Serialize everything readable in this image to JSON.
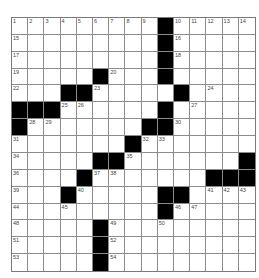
{
  "puzzle": {
    "rows": 15,
    "cols": 15,
    "colors": {
      "block": "#000000",
      "cell": "#ffffff",
      "gridline": "#8c8c8c",
      "number": "#444444"
    },
    "layout": [
      ".........#.....",
      ".........#.....",
      ".........#.....",
      ".....#...#.....",
      "...##.....#....",
      "###......#.....",
      "#.......##.....",
      ".......#.......",
      ".....##.......#",
      "....#.......###",
      "...#.....##....",
      ".........#.....",
      ".....#.........",
      ".....#.........",
      ".....#........."
    ],
    "numbers": [
      {
        "r": 0,
        "c": 0,
        "n": "1"
      },
      {
        "r": 0,
        "c": 1,
        "n": "2"
      },
      {
        "r": 0,
        "c": 2,
        "n": "3"
      },
      {
        "r": 0,
        "c": 3,
        "n": "4"
      },
      {
        "r": 0,
        "c": 4,
        "n": "5"
      },
      {
        "r": 0,
        "c": 5,
        "n": "6"
      },
      {
        "r": 0,
        "c": 6,
        "n": "7"
      },
      {
        "r": 0,
        "c": 7,
        "n": "8"
      },
      {
        "r": 0,
        "c": 8,
        "n": "9"
      },
      {
        "r": 0,
        "c": 10,
        "n": "10"
      },
      {
        "r": 0,
        "c": 11,
        "n": "11"
      },
      {
        "r": 0,
        "c": 12,
        "n": "12"
      },
      {
        "r": 0,
        "c": 13,
        "n": "13"
      },
      {
        "r": 0,
        "c": 14,
        "n": "14"
      },
      {
        "r": 1,
        "c": 0,
        "n": "15"
      },
      {
        "r": 1,
        "c": 10,
        "n": "16"
      },
      {
        "r": 2,
        "c": 0,
        "n": "17"
      },
      {
        "r": 2,
        "c": 10,
        "n": "18"
      },
      {
        "r": 3,
        "c": 0,
        "n": "19"
      },
      {
        "r": 3,
        "c": 6,
        "n": "20"
      },
      {
        "r": 3,
        "c": 9,
        "n": "21"
      },
      {
        "r": 4,
        "c": 0,
        "n": "22"
      },
      {
        "r": 4,
        "c": 5,
        "n": "23"
      },
      {
        "r": 4,
        "c": 12,
        "n": "24"
      },
      {
        "r": 5,
        "c": 3,
        "n": "25"
      },
      {
        "r": 5,
        "c": 4,
        "n": "26"
      },
      {
        "r": 5,
        "c": 11,
        "n": "27"
      },
      {
        "r": 6,
        "c": 1,
        "n": "28"
      },
      {
        "r": 6,
        "c": 2,
        "n": "29"
      },
      {
        "r": 6,
        "c": 10,
        "n": "30"
      },
      {
        "r": 7,
        "c": 0,
        "n": "31"
      },
      {
        "r": 7,
        "c": 8,
        "n": "32"
      },
      {
        "r": 7,
        "c": 9,
        "n": "33"
      },
      {
        "r": 8,
        "c": 0,
        "n": "34"
      },
      {
        "r": 8,
        "c": 7,
        "n": "35"
      },
      {
        "r": 9,
        "c": 0,
        "n": "36"
      },
      {
        "r": 9,
        "c": 5,
        "n": "37"
      },
      {
        "r": 9,
        "c": 6,
        "n": "38"
      },
      {
        "r": 10,
        "c": 0,
        "n": "39"
      },
      {
        "r": 10,
        "c": 4,
        "n": "40"
      },
      {
        "r": 10,
        "c": 12,
        "n": "41"
      },
      {
        "r": 10,
        "c": 13,
        "n": "42"
      },
      {
        "r": 10,
        "c": 14,
        "n": "43"
      },
      {
        "r": 11,
        "c": 0,
        "n": "44"
      },
      {
        "r": 11,
        "c": 3,
        "n": "45"
      },
      {
        "r": 11,
        "c": 10,
        "n": "46"
      },
      {
        "r": 11,
        "c": 11,
        "n": "47"
      },
      {
        "r": 12,
        "c": 0,
        "n": "48"
      },
      {
        "r": 12,
        "c": 6,
        "n": "49"
      },
      {
        "r": 12,
        "c": 9,
        "n": "50"
      },
      {
        "r": 13,
        "c": 0,
        "n": "51"
      },
      {
        "r": 13,
        "c": 6,
        "n": "52"
      },
      {
        "r": 14,
        "c": 0,
        "n": "53"
      },
      {
        "r": 14,
        "c": 6,
        "n": "54"
      }
    ]
  }
}
